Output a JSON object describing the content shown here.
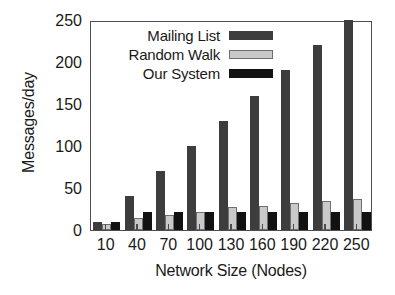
{
  "chart_data": {
    "type": "bar",
    "title": "",
    "xlabel": "Network Size (Nodes)",
    "ylabel": "Messages/day",
    "categories": [
      "10",
      "40",
      "70",
      "100",
      "130",
      "160",
      "190",
      "220",
      "250"
    ],
    "series": [
      {
        "name": "Mailing List",
        "color": "#3d3d3d",
        "values": [
          10,
          40,
          70,
          100,
          130,
          160,
          190,
          220,
          250
        ]
      },
      {
        "name": "Random Walk",
        "color": "#c9c9c9",
        "values": [
          7,
          14,
          18,
          22,
          27,
          28,
          32,
          34,
          37
        ]
      },
      {
        "name": "Our System",
        "color": "#121212",
        "values": [
          9,
          21,
          21,
          21,
          21,
          21,
          21,
          21,
          21
        ]
      }
    ],
    "ylim": [
      0,
      250
    ],
    "yticks": [
      0,
      50,
      100,
      150,
      200,
      250
    ],
    "ytick_labels": [
      "0",
      "50",
      "100",
      "150",
      "200",
      "250"
    ],
    "grid": false,
    "legend_position": "top-left",
    "legend_entries": [
      "Mailing List",
      "Random Walk",
      "Our System"
    ]
  }
}
